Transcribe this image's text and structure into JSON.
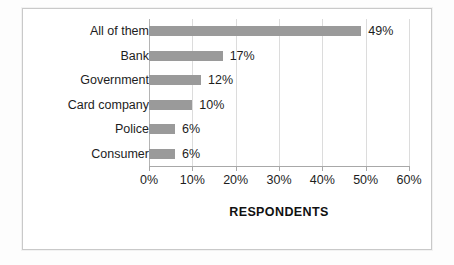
{
  "chart_data": {
    "type": "bar",
    "orientation": "horizontal",
    "title": "",
    "xlabel": "RESPONDENTS",
    "ylabel": "",
    "categories": [
      "All of them",
      "Bank",
      "Government",
      "Card company",
      "Police",
      "Consumer"
    ],
    "values": [
      49,
      17,
      12,
      10,
      6,
      6
    ],
    "value_labels": [
      "49%",
      "17%",
      "12%",
      "10%",
      "6%",
      "6%"
    ],
    "xlim": [
      0,
      60
    ],
    "xticks": [
      0,
      10,
      20,
      30,
      40,
      50,
      60
    ],
    "xticklabels": [
      "0%",
      "10%",
      "20%",
      "30%",
      "40%",
      "50%",
      "60%"
    ],
    "grid": true,
    "legend": false,
    "bar_color": "#9a9a9a",
    "gridline_color": "#dcdcdc",
    "axis_color": "#a8a8a8",
    "text_color": "#1d1d1d",
    "background_color": "#ffffff"
  }
}
